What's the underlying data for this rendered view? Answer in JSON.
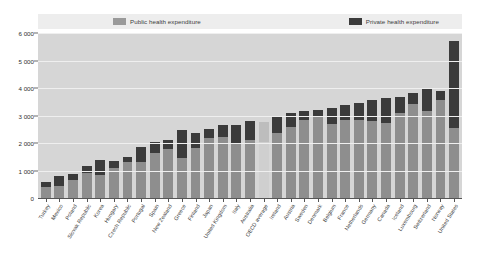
{
  "legend": {
    "public_label": "Public health expenditure",
    "private_label": "Private health expenditure",
    "public_color": "#8e8e8e",
    "private_color": "#3b3b3b"
  },
  "axis": {
    "yticks": [
      "0",
      "1 000",
      "2 000",
      "3 000",
      "4 000",
      "5 000",
      "6 000"
    ]
  },
  "chart_data": {
    "type": "bar",
    "title": "",
    "subtitle": "",
    "xlabel": "",
    "ylabel": "",
    "ylim": [
      0,
      6000
    ],
    "ytick_values": [
      0,
      1000,
      2000,
      3000,
      4000,
      5000,
      6000
    ],
    "grid": true,
    "stacked": true,
    "legend_position": "top",
    "legend": [
      "Public health expenditure",
      "Private health expenditure"
    ],
    "categories": [
      "Turkey",
      "Mexico",
      "Poland",
      "Slovak Republic",
      "Korea",
      "Hungary",
      "Czech Republic",
      "Portugal",
      "Spain",
      "New Zealand",
      "Greece",
      "Finland",
      "Japan",
      "United Kingdom",
      "Italy",
      "Australia",
      "OECD average",
      "Ireland",
      "Austria",
      "Sweden",
      "Denmark",
      "Belgium",
      "France",
      "Netherlands",
      "Germany",
      "Canada",
      "Iceland",
      "Luxembourg",
      "Switzerland",
      "Norway",
      "United States"
    ],
    "series": [
      {
        "name": "Public health expenditure",
        "color": "#8e8e8e",
        "values": [
          400,
          440,
          640,
          920,
          830,
          1100,
          1320,
          1300,
          1620,
          1800,
          1460,
          1830,
          2200,
          2230,
          2000,
          2110,
          2020,
          2350,
          2600,
          2830,
          2930,
          2690,
          2840,
          2830,
          2790,
          2710,
          3080,
          3420,
          3160,
          3570,
          2560
        ]
      },
      {
        "name": "Private health expenditure",
        "color": "#3b3b3b",
        "values": [
          180,
          350,
          230,
          240,
          540,
          250,
          170,
          560,
          400,
          320,
          1020,
          540,
          300,
          410,
          660,
          700,
          740,
          580,
          480,
          320,
          260,
          590,
          530,
          630,
          760,
          930,
          610,
          390,
          800,
          330,
          3150
        ]
      }
    ],
    "totals": [
      580,
      790,
      870,
      1160,
      1370,
      1350,
      1490,
      1860,
      2020,
      2120,
      2480,
      2370,
      2500,
      2640,
      2660,
      2810,
      2760,
      2930,
      3080,
      3150,
      3190,
      3280,
      3370,
      3460,
      3550,
      3640,
      3690,
      3810,
      3960,
      3900,
      5710
    ]
  }
}
